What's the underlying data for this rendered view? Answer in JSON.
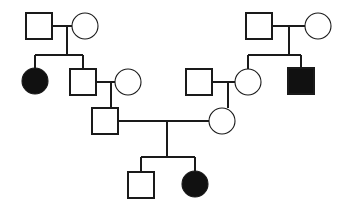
{
  "chart": {
    "type": "pedigree",
    "title": "",
    "width": 344,
    "height": 211,
    "background_color": "#ffffff",
    "line_color": "#1a1a1a",
    "affected_fill": "#111111",
    "unaffected_fill": "#ffffff",
    "symbol_size": 26,
    "legend": {
      "male_symbol": "square",
      "female_symbol": "circle",
      "affected_meaning": "filled",
      "unaffected_meaning": "open"
    },
    "individuals": [
      {
        "id": "I-1",
        "sex": "male",
        "shape": "square",
        "affected": false,
        "generation": 1,
        "cx": 39,
        "cy": 26
      },
      {
        "id": "I-2",
        "sex": "female",
        "shape": "circle",
        "affected": false,
        "generation": 1,
        "cx": 85,
        "cy": 26
      },
      {
        "id": "I-3",
        "sex": "male",
        "shape": "square",
        "affected": false,
        "generation": 1,
        "cx": 259,
        "cy": 26
      },
      {
        "id": "I-4",
        "sex": "female",
        "shape": "circle",
        "affected": false,
        "generation": 1,
        "cx": 318,
        "cy": 26
      },
      {
        "id": "II-1",
        "sex": "female",
        "shape": "circle",
        "affected": true,
        "generation": 2,
        "cx": 35,
        "cy": 81
      },
      {
        "id": "II-2",
        "sex": "male",
        "shape": "square",
        "affected": false,
        "generation": 2,
        "cx": 83,
        "cy": 82
      },
      {
        "id": "II-3",
        "sex": "female",
        "shape": "circle",
        "affected": false,
        "generation": 2,
        "cx": 128,
        "cy": 82
      },
      {
        "id": "II-4",
        "sex": "male",
        "shape": "square",
        "affected": false,
        "generation": 2,
        "cx": 199,
        "cy": 82
      },
      {
        "id": "II-5",
        "sex": "female",
        "shape": "circle",
        "affected": false,
        "generation": 2,
        "cx": 248,
        "cy": 82
      },
      {
        "id": "II-6",
        "sex": "male",
        "shape": "square",
        "affected": true,
        "generation": 2,
        "cx": 301,
        "cy": 81
      },
      {
        "id": "III-1",
        "sex": "male",
        "shape": "square",
        "affected": false,
        "generation": 3,
        "cx": 105,
        "cy": 121
      },
      {
        "id": "III-2",
        "sex": "female",
        "shape": "circle",
        "affected": false,
        "generation": 3,
        "cx": 222,
        "cy": 121
      },
      {
        "id": "IV-1",
        "sex": "male",
        "shape": "square",
        "affected": false,
        "generation": 4,
        "cx": 141,
        "cy": 185
      },
      {
        "id": "IV-2",
        "sex": "female",
        "shape": "circle",
        "affected": true,
        "generation": 4,
        "cx": 195,
        "cy": 184
      }
    ],
    "matings": [
      {
        "partners": [
          "I-1",
          "I-2"
        ],
        "children": [
          "II-1",
          "II-2"
        ]
      },
      {
        "partners": [
          "I-3",
          "I-4"
        ],
        "children": [
          "II-5",
          "II-6"
        ]
      },
      {
        "partners": [
          "II-2",
          "II-3"
        ],
        "children": [
          "III-1"
        ]
      },
      {
        "partners": [
          "II-4",
          "II-5"
        ],
        "children": [
          "III-2"
        ]
      },
      {
        "partners": [
          "III-1",
          "III-2"
        ],
        "children": [
          "IV-1",
          "IV-2"
        ]
      }
    ],
    "counts": {
      "total_individuals": 14,
      "affected_individuals": 3,
      "generations": 4,
      "males": 7,
      "females": 7
    }
  }
}
